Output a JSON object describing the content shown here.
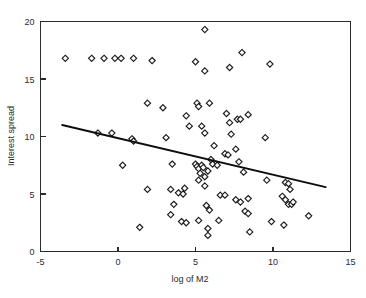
{
  "chart_data": {
    "type": "scatter",
    "title": "",
    "xlabel": "log of M2",
    "ylabel": "Interest spread",
    "xlim": [
      -5,
      15
    ],
    "ylim": [
      0,
      20
    ],
    "xticks": [
      -5,
      0,
      5,
      10,
      15
    ],
    "yticks": [
      0,
      5,
      10,
      15,
      20
    ],
    "xtick_labels": [
      "-5",
      "0",
      "5",
      "10",
      "15"
    ],
    "ytick_labels": [
      "0",
      "5",
      "10",
      "15",
      "20"
    ],
    "grid": false,
    "legend": false,
    "marker": "diamond",
    "marker_fill": "#ffffff",
    "marker_edge": "#1a1a1a",
    "line_color": "#0d0d0d",
    "frame_color": "#2b2b2b",
    "points": [
      [
        -3.4,
        16.8
      ],
      [
        -1.7,
        16.8
      ],
      [
        -0.9,
        16.8
      ],
      [
        -0.2,
        16.8
      ],
      [
        0.2,
        16.8
      ],
      [
        1.0,
        16.8
      ],
      [
        2.2,
        16.6
      ],
      [
        5.0,
        16.5
      ],
      [
        5.6,
        15.7
      ],
      [
        7.2,
        16.0
      ],
      [
        8.0,
        17.3
      ],
      [
        9.8,
        16.3
      ],
      [
        5.6,
        19.3
      ],
      [
        -1.3,
        10.3
      ],
      [
        -0.4,
        10.3
      ],
      [
        0.9,
        9.8
      ],
      [
        1.0,
        9.6
      ],
      [
        1.9,
        12.9
      ],
      [
        2.9,
        12.5
      ],
      [
        3.1,
        9.9
      ],
      [
        4.4,
        11.8
      ],
      [
        4.6,
        10.9
      ],
      [
        5.1,
        12.9
      ],
      [
        5.2,
        12.6
      ],
      [
        5.4,
        10.9
      ],
      [
        5.6,
        10.3
      ],
      [
        5.9,
        12.9
      ],
      [
        6.2,
        9.2
      ],
      [
        7.0,
        12.0
      ],
      [
        7.2,
        11.2
      ],
      [
        7.3,
        10.2
      ],
      [
        7.7,
        11.5
      ],
      [
        7.9,
        11.5
      ],
      [
        8.4,
        11.9
      ],
      [
        9.5,
        9.9
      ],
      [
        0.3,
        7.5
      ],
      [
        3.5,
        7.6
      ],
      [
        5.0,
        7.6
      ],
      [
        5.1,
        7.4
      ],
      [
        5.2,
        7.2
      ],
      [
        5.3,
        6.8
      ],
      [
        5.4,
        7.5
      ],
      [
        5.5,
        7.3
      ],
      [
        5.6,
        6.5
      ],
      [
        5.8,
        7.0
      ],
      [
        6.0,
        8.0
      ],
      [
        6.1,
        7.6
      ],
      [
        6.4,
        7.5
      ],
      [
        6.9,
        8.5
      ],
      [
        7.1,
        8.4
      ],
      [
        7.6,
        8.9
      ],
      [
        7.8,
        7.8
      ],
      [
        8.1,
        6.9
      ],
      [
        9.6,
        6.2
      ],
      [
        10.8,
        6.0
      ],
      [
        11.0,
        5.9
      ],
      [
        11.1,
        5.4
      ],
      [
        1.9,
        5.4
      ],
      [
        3.4,
        5.4
      ],
      [
        3.9,
        5.1
      ],
      [
        4.2,
        5.0
      ],
      [
        4.3,
        5.5
      ],
      [
        5.2,
        6.2
      ],
      [
        5.6,
        5.7
      ],
      [
        3.6,
        4.1
      ],
      [
        3.4,
        3.2
      ],
      [
        5.7,
        4.0
      ],
      [
        5.9,
        3.6
      ],
      [
        6.6,
        4.9
      ],
      [
        6.9,
        4.9
      ],
      [
        7.6,
        4.5
      ],
      [
        8.4,
        4.6
      ],
      [
        7.9,
        4.3
      ],
      [
        10.6,
        4.8
      ],
      [
        10.8,
        4.5
      ],
      [
        11.0,
        4.1
      ],
      [
        11.2,
        4.1
      ],
      [
        11.3,
        4.3
      ],
      [
        4.1,
        2.6
      ],
      [
        4.4,
        2.5
      ],
      [
        5.2,
        2.7
      ],
      [
        6.5,
        2.7
      ],
      [
        8.2,
        3.5
      ],
      [
        8.4,
        3.3
      ],
      [
        8.5,
        1.7
      ],
      [
        5.8,
        2.0
      ],
      [
        5.8,
        1.4
      ],
      [
        9.9,
        2.6
      ],
      [
        10.7,
        2.3
      ],
      [
        12.3,
        3.1
      ],
      [
        1.4,
        2.1
      ]
    ],
    "trend_line": {
      "x_start": -3.6,
      "y_start": 11.0,
      "x_end": 13.4,
      "y_end": 5.6
    }
  }
}
